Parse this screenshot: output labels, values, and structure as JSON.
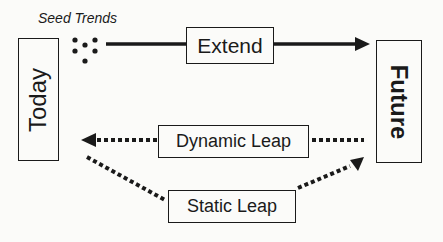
{
  "diagram": {
    "seed_label": "Seed Trends",
    "nodes": {
      "today": "Today",
      "future": "Future",
      "extend": "Extend",
      "dynamic_leap": "Dynamic Leap",
      "static_leap": "Static Leap"
    },
    "edges": [
      {
        "from": "seed_trends",
        "to": "future",
        "via": "Extend",
        "style": "solid"
      },
      {
        "from": "future",
        "to": "today",
        "via": "Dynamic Leap",
        "style": "dotted"
      },
      {
        "from": "today",
        "to": "future",
        "via": "Static Leap",
        "style": "dotted"
      }
    ],
    "colors": {
      "ink": "#1a1a1a",
      "background": "#fbfbf9"
    }
  }
}
